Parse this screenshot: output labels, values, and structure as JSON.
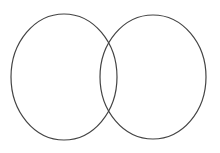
{
  "diagram": {
    "type": "venn",
    "background": "#ffffff",
    "stroke_color": "#444444",
    "stroke_width": 1.2,
    "sets": [
      {
        "name": "left-set",
        "cx": 64,
        "cy": 77,
        "rx": 53,
        "ry": 63
      },
      {
        "name": "right-set",
        "cx": 153,
        "cy": 77,
        "rx": 53,
        "ry": 62
      }
    ]
  }
}
